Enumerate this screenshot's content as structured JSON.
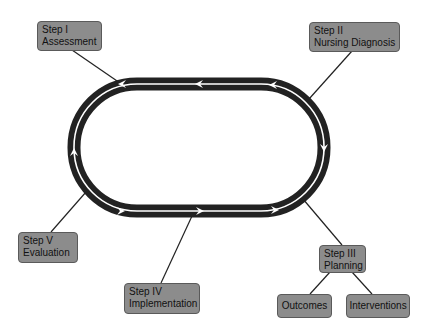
{
  "diagram": {
    "type": "cycle",
    "cycle_direction": "clockwise",
    "colors": {
      "ring": "#222222",
      "node_fill": "#8c8c8c",
      "node_border": "#5a5a5a",
      "connector": "#222222"
    },
    "nodes": [
      {
        "id": "step1",
        "line1": "Step I",
        "line2": "Assessment"
      },
      {
        "id": "step2",
        "line1": "Step II",
        "line2": "Nursing Diagnosis"
      },
      {
        "id": "step3",
        "line1": "Step III",
        "line2": "Planning"
      },
      {
        "id": "step4",
        "line1": "Step IV",
        "line2": "Implementation"
      },
      {
        "id": "step5",
        "line1": "Step V",
        "line2": "Evaluation"
      },
      {
        "id": "outcomes",
        "label": "Outcomes"
      },
      {
        "id": "interventions",
        "label": "Interventions"
      }
    ],
    "edges": [
      {
        "from": "step1",
        "to": "cycle"
      },
      {
        "from": "step2",
        "to": "cycle"
      },
      {
        "from": "step3",
        "to": "cycle"
      },
      {
        "from": "step4",
        "to": "cycle"
      },
      {
        "from": "step5",
        "to": "cycle"
      },
      {
        "from": "step3",
        "to": "outcomes"
      },
      {
        "from": "step3",
        "to": "interventions"
      }
    ]
  }
}
